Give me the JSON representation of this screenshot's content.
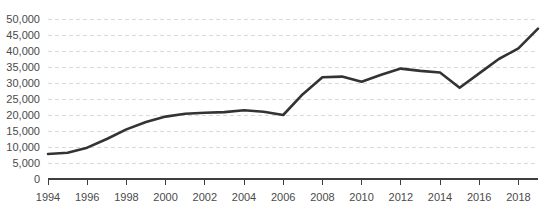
{
  "chart_data": {
    "type": "line",
    "title": "",
    "subtitle": "",
    "xlabel": "",
    "ylabel": "",
    "x": [
      1994,
      1995,
      1996,
      1997,
      1998,
      1999,
      2000,
      2001,
      2002,
      2003,
      2004,
      2005,
      2006,
      2007,
      2008,
      2009,
      2010,
      2011,
      2012,
      2013,
      2014,
      2015,
      2016,
      2017,
      2018,
      2019
    ],
    "values": [
      7800,
      8200,
      9800,
      12500,
      15500,
      17800,
      19500,
      20400,
      20700,
      20900,
      21500,
      21000,
      20000,
      26500,
      31800,
      32000,
      30400,
      32600,
      34500,
      33800,
      33300,
      28500,
      33000,
      37500,
      40800,
      47000
    ],
    "series": [
      {
        "name": "series-1",
        "color": "#333333",
        "values": [
          7800,
          8200,
          9800,
          12500,
          15500,
          17800,
          19500,
          20400,
          20700,
          20900,
          21500,
          21000,
          20000,
          26500,
          31800,
          32000,
          30400,
          32600,
          34500,
          33800,
          33300,
          28500,
          33000,
          37500,
          40800,
          47000
        ]
      }
    ],
    "ylim": [
      0,
      50000
    ],
    "xlim": [
      1994,
      2019
    ],
    "ytick_values": [
      0,
      5000,
      10000,
      15000,
      20000,
      25000,
      30000,
      35000,
      40000,
      45000,
      50000
    ],
    "ytick_labels": [
      "0",
      "5,000",
      "10,000",
      "15,000",
      "20,000",
      "25,000",
      "30,000",
      "35,000",
      "40,000",
      "45,000",
      "50,000"
    ],
    "xtick_values": [
      1994,
      1996,
      1998,
      2000,
      2002,
      2004,
      2006,
      2008,
      2010,
      2012,
      2014,
      2016,
      2018
    ],
    "xtick_labels": [
      "1994",
      "1996",
      "1998",
      "2000",
      "2002",
      "2004",
      "2006",
      "2008",
      "2010",
      "2012",
      "2014",
      "2016",
      "2018"
    ],
    "grid": true,
    "grid_axis": "y",
    "grid_style": "dashed",
    "grid_color": "#d9d9d9",
    "legend": false,
    "legend_position": "none",
    "line_color": "#333333",
    "line_width": 2.6,
    "axis_color": "#3f3f3f",
    "tick_label_color": "#4a4a4a",
    "background_color": "#ffffff"
  }
}
